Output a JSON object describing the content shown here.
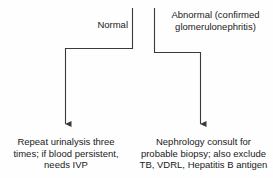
{
  "diagram": {
    "type": "flowchart",
    "clipped_top_caption": "",
    "branches": [
      {
        "id": "normal",
        "label": "Normal",
        "outcome": "Repeat urinalysis three\ntimes; if blood persistent,\nneeds IVP"
      },
      {
        "id": "abnormal",
        "label": "Abnormal (confirmed\nglomerulonephritis)",
        "outcome": "Nephrology consult for\nprobable biopsy; also exclude\nTB, VDRL, Hepatitis B antigen"
      }
    ],
    "colors": {
      "line": "#3a3a3a",
      "text": "#1a1a1a",
      "background": "#fefefe"
    }
  }
}
